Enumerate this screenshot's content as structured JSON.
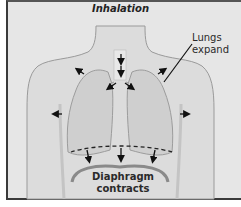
{
  "figure": {
    "title": "Inhalation",
    "labels": {
      "lungs": {
        "line1": "Lungs",
        "line2": "expand"
      },
      "diaphragm": {
        "line1": "Diaphragm",
        "line2": "contracts"
      }
    },
    "icons": [
      "arrow-outward-icon",
      "arrow-down-icon",
      "dashed-diaphragm-line",
      "leader-line"
    ],
    "colors": {
      "background": "#e6e6e6",
      "body_fill": "#dedede",
      "lung_fill": "#d2d2d2",
      "diaphragm": "#8a8a8a",
      "outline": "#3a3a3a",
      "text": "#222222"
    }
  }
}
